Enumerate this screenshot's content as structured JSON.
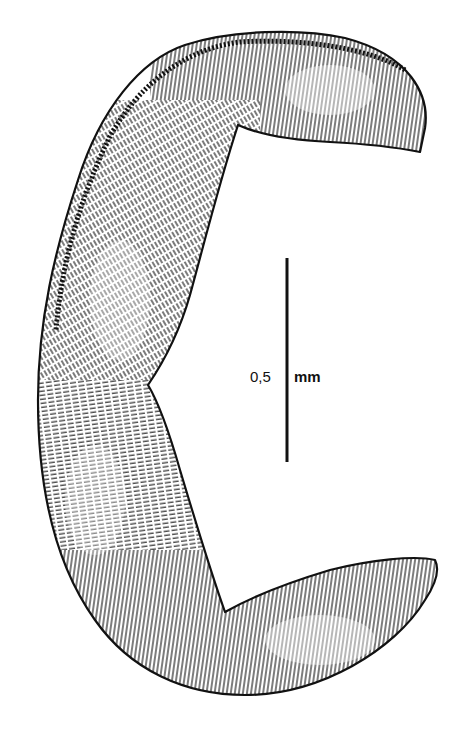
{
  "figure": {
    "type": "scientific line illustration",
    "colors": {
      "ink": "#111111",
      "background": "#ffffff"
    }
  },
  "scale_bar": {
    "value": "0,5",
    "unit": "mm",
    "orientation": "vertical"
  }
}
